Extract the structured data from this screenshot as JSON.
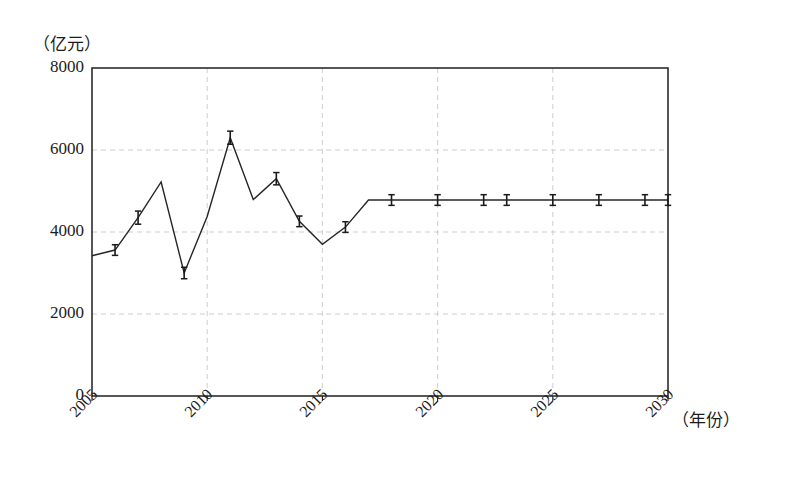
{
  "chart_data": {
    "type": "line",
    "title": "",
    "subtitle": "",
    "xlabel": "（年份）",
    "ylabel": "（亿元）",
    "ylim": [
      0,
      8000
    ],
    "xlim": [
      2005,
      2030
    ],
    "grid": true,
    "legend_position": "none",
    "y_ticks": [
      0,
      2000,
      4000,
      6000,
      8000
    ],
    "y_tick_labels": [
      "0",
      "2000",
      "4000",
      "6000",
      "8000"
    ],
    "x_ticks": [
      2005,
      2010,
      2015,
      2020,
      2025,
      2030
    ],
    "x_tick_labels": [
      "2005",
      "2010",
      "2015",
      "2020",
      "2025",
      "2030"
    ],
    "x": [
      2005,
      2006,
      2007,
      2008,
      2009,
      2010,
      2011,
      2012,
      2013,
      2014,
      2015,
      2016,
      2017,
      2018,
      2019,
      2020,
      2021,
      2022,
      2023,
      2024,
      2025,
      2026,
      2027,
      2028,
      2029,
      2030
    ],
    "values": [
      3420,
      3560,
      4350,
      5220,
      3000,
      4380,
      6300,
      4790,
      5300,
      4260,
      3700,
      4120,
      4780,
      4780,
      4780,
      4780,
      4780,
      4780,
      4780,
      4780,
      4780,
      4780,
      4780,
      4780,
      4780,
      4780
    ],
    "error_bars": [
      0,
      130,
      160,
      0,
      140,
      0,
      160,
      0,
      150,
      130,
      0,
      130,
      0,
      130,
      0,
      130,
      0,
      130,
      130,
      0,
      130,
      0,
      130,
      0,
      130,
      130
    ],
    "series": [
      {
        "name": "金额",
        "values": [
          3420,
          3560,
          4350,
          5220,
          3000,
          4380,
          6300,
          4790,
          5300,
          4260,
          3700,
          4120,
          4780,
          4780,
          4780,
          4780,
          4780,
          4780,
          4780,
          4780,
          4780,
          4780,
          4780,
          4780,
          4780,
          4780
        ]
      }
    ],
    "annotations": [],
    "colors": {
      "line": "#262626",
      "grid": "#c8c8c8",
      "axis": "#1f1f1f",
      "error_bar": "#1a1a1a"
    }
  },
  "axis_labels": {
    "y_unit": "（亿元）",
    "x_unit": "（年份）"
  }
}
